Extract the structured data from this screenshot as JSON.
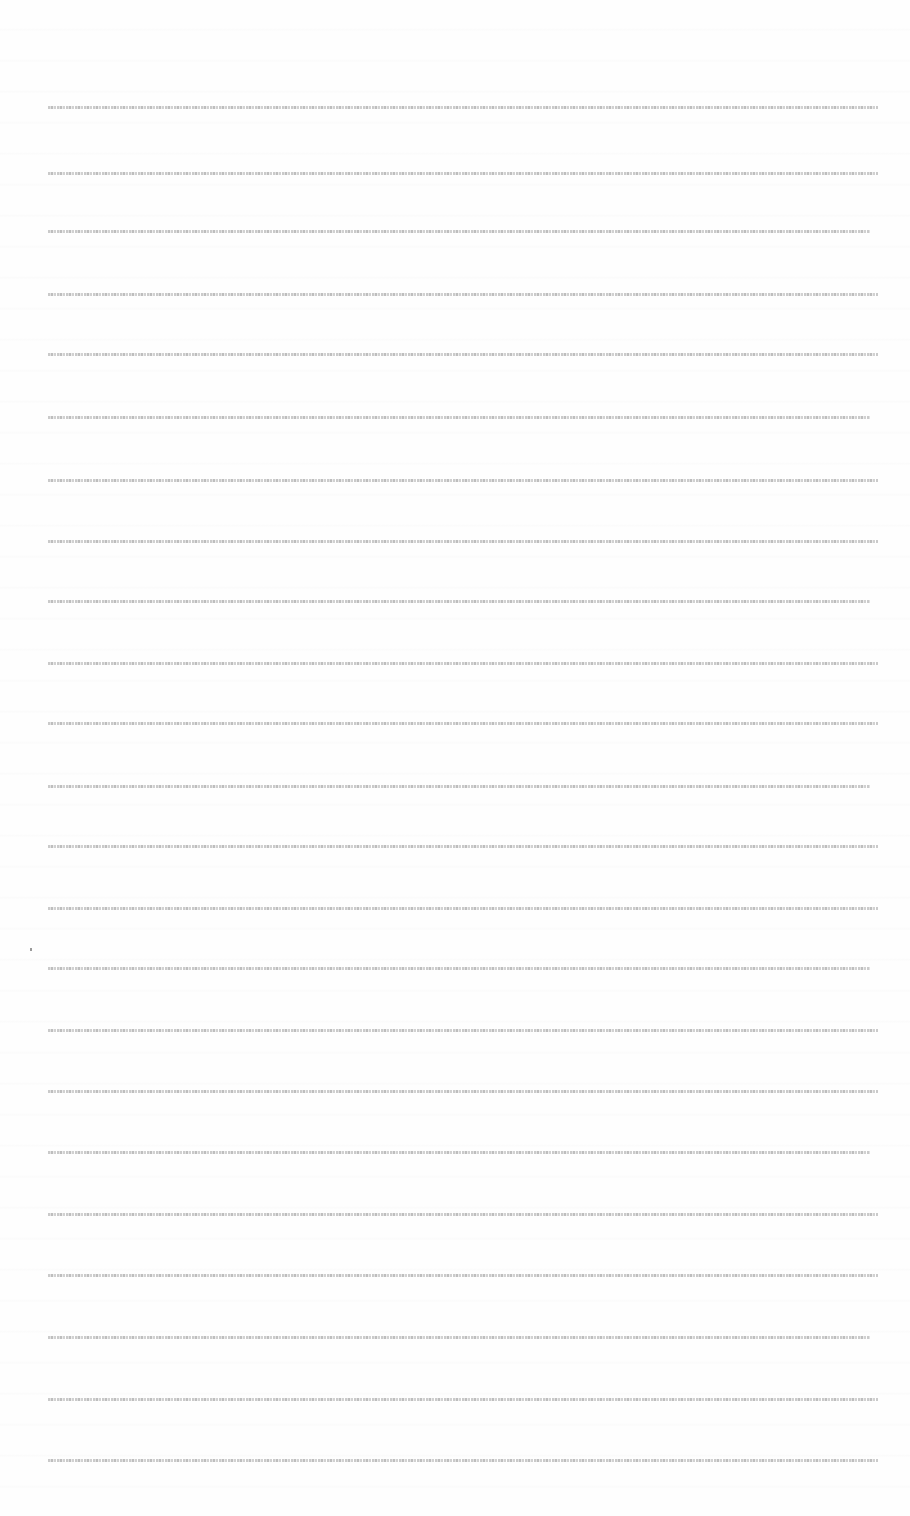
{
  "document": {
    "kind": "scanned page with illegible micro-text lines",
    "line_count": 23,
    "lines": [
      "",
      "",
      "",
      "",
      "",
      "",
      "",
      "",
      "",
      "",
      "",
      "",
      "",
      "",
      "",
      "",
      "",
      "",
      "",
      "",
      "",
      "",
      ""
    ],
    "text_color": "#b9b9b9",
    "background_color": "#ffffff"
  }
}
